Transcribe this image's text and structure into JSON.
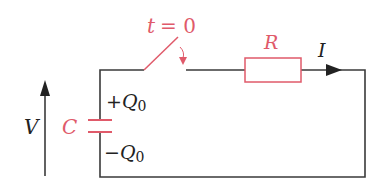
{
  "diagram": {
    "type": "RC discharge circuit",
    "colors": {
      "wire": "#3a3a3a",
      "component": "#e05a6a",
      "background": "#ffffff"
    },
    "switch": {
      "label": "t = 0",
      "label_var": "t",
      "label_eq": "= 0"
    },
    "resistor": {
      "label": "R"
    },
    "current": {
      "label": "I"
    },
    "capacitor": {
      "label": "C"
    },
    "charge_top": {
      "sign": "+",
      "symbol": "Q",
      "subscript": "0"
    },
    "charge_bottom": {
      "sign": "−",
      "symbol": "Q",
      "subscript": "0"
    },
    "voltage": {
      "label": "V"
    }
  }
}
